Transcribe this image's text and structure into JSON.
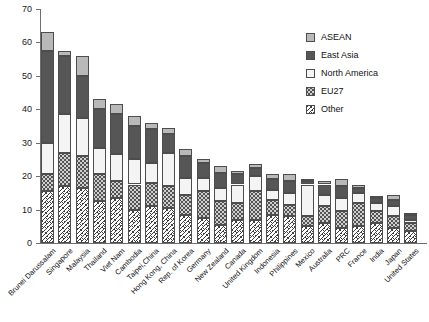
{
  "chart_data": {
    "type": "bar",
    "stacked": true,
    "title": "",
    "xlabel": "",
    "ylabel": "",
    "ylim": [
      0,
      70
    ],
    "ytick_values": [
      0,
      10,
      20,
      30,
      40,
      50,
      60,
      70
    ],
    "ytick_labels": [
      "0",
      "10",
      "20",
      "30",
      "40",
      "50",
      "60",
      "70"
    ],
    "grid": false,
    "legend_position": "upper-right",
    "categories": [
      "Brunei Darussalam",
      "Singapore",
      "Malaysia",
      "Thailand",
      "Viet Nam",
      "Cambodia",
      "Taipei,China",
      "Hong Kong, China",
      "Rep. of Korea",
      "Germany",
      "New Zealand",
      "Canada",
      "United Kingdom",
      "Indonesia",
      "Philippines",
      "Mexico",
      "Australia",
      "PRC",
      "France",
      "India",
      "Japan",
      "United States"
    ],
    "series": [
      {
        "name": "Other",
        "color": "#ffffff",
        "pattern": "cross-hatch",
        "values": [
          15.5,
          17.0,
          16.5,
          12.5,
          13.5,
          10.0,
          11.0,
          10.5,
          8.5,
          7.5,
          5.5,
          7.0,
          7.0,
          8.5,
          8.0,
          5.0,
          6.0,
          4.5,
          5.0,
          6.0,
          4.5,
          3.5
        ]
      },
      {
        "name": "EU27",
        "color": "#cfcfcf",
        "pattern": "dotted",
        "values": [
          5.0,
          10.0,
          9.5,
          8.0,
          5.0,
          7.5,
          7.0,
          6.5,
          6.0,
          8.0,
          7.0,
          5.0,
          8.5,
          4.5,
          3.5,
          3.0,
          5.0,
          5.0,
          7.0,
          3.5,
          3.5,
          2.5
        ]
      },
      {
        "name": "North America",
        "color": "#f4f4f4",
        "pattern": "solid",
        "values": [
          9.5,
          11.5,
          11.5,
          8.0,
          8.0,
          7.5,
          6.0,
          10.0,
          5.0,
          4.0,
          4.0,
          5.5,
          4.5,
          3.0,
          3.5,
          9.5,
          3.5,
          4.0,
          3.0,
          2.5,
          3.0,
          1.0
        ]
      },
      {
        "name": "East Asia",
        "color": "#565656",
        "pattern": "solid",
        "values": [
          27.5,
          17.5,
          12.5,
          11.5,
          12.0,
          10.0,
          10.0,
          5.5,
          6.5,
          4.5,
          4.5,
          3.0,
          2.5,
          3.0,
          3.5,
          1.0,
          3.0,
          3.5,
          1.5,
          1.5,
          2.0,
          1.5
        ]
      },
      {
        "name": "ASEAN",
        "color": "#b9b9b9",
        "pattern": "solid",
        "values": [
          5.5,
          1.5,
          6.0,
          3.0,
          3.0,
          3.0,
          2.0,
          2.0,
          2.0,
          1.0,
          2.0,
          1.0,
          1.0,
          1.5,
          2.0,
          0.5,
          1.0,
          2.0,
          1.0,
          0.5,
          1.5,
          0.5
        ]
      }
    ],
    "totals": [
      63.0,
      57.5,
      56.0,
      43.0,
      41.5,
      38.0,
      36.0,
      34.5,
      28.0,
      25.0,
      23.0,
      21.5,
      23.5,
      20.5,
      20.5,
      19.0,
      18.5,
      19.0,
      17.5,
      14.0,
      14.5,
      9.0
    ]
  },
  "legend": {
    "items": [
      {
        "label": "ASEAN",
        "swatch": "asean"
      },
      {
        "label": "East Asia",
        "swatch": "easia"
      },
      {
        "label": "North America",
        "swatch": "namer"
      },
      {
        "label": "EU27",
        "swatch": "eu27"
      },
      {
        "label": "Other",
        "swatch": "other"
      }
    ]
  },
  "colors": {
    "asean": "#b9b9b9",
    "east_asia": "#565656",
    "north_america": "#f4f4f4",
    "eu27": "#cfcfcf",
    "other": "#ffffff",
    "axis": "#6f6f6f",
    "outline": "#4d4d4d"
  }
}
